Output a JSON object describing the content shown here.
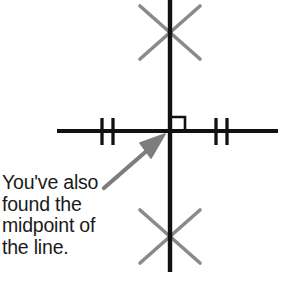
{
  "diagram": {
    "type": "geometric-construction",
    "canvas": {
      "width": 285,
      "height": 296,
      "background": "#ffffff"
    },
    "colors": {
      "line": "#111111",
      "construction_arc": "#8a8a8a",
      "arrow": "#7d7d7d",
      "text": "#1a1a1a"
    },
    "elements": {
      "vertical_line": {
        "label": "perpendicular bisector",
        "x": 170,
        "y_start": 0,
        "y_end": 272,
        "stroke_width": 4.2,
        "color": "#111111"
      },
      "horizontal_line": {
        "label": "original line segment",
        "y": 131,
        "x_start": 57,
        "x_end": 278,
        "stroke_width": 4.2,
        "color": "#111111"
      },
      "right_angle_marker": {
        "label": "right angle symbol",
        "x": 172,
        "y": 117,
        "size": 13,
        "stroke_width": 2.6,
        "color": "#111111"
      },
      "tick_marks": {
        "label": "equal length tick marks",
        "count": 4,
        "pairs": 2,
        "y_top": 118,
        "y_bottom": 145,
        "stroke_width": 3.2,
        "color": "#111111",
        "x_positions": [
          102,
          113,
          216,
          227
        ]
      },
      "arc_cross_top": {
        "label": "upper construction arc intersection",
        "center_x": 170,
        "center_y": 32,
        "half_width": 30,
        "half_height": 27,
        "stroke_width": 3.6,
        "color": "#8a8a8a"
      },
      "arc_cross_bottom": {
        "label": "lower construction arc intersection",
        "center_x": 170,
        "center_y": 236,
        "half_width": 30,
        "half_height": 27,
        "stroke_width": 3.6,
        "color": "#8a8a8a"
      },
      "pointer_arrow": {
        "label": "arrow pointing to midpoint",
        "tail_x": 104,
        "tail_y": 188,
        "tip_x": 164,
        "tip_y": 136,
        "stroke_width": 4.2,
        "head_length": 22,
        "head_width": 17,
        "color": "#7d7d7d"
      }
    }
  },
  "caption": {
    "name": "midpoint-caption",
    "full_text": "You've also found the midpoint of the line.",
    "lines": [
      "You've also",
      "found the",
      "midpoint of",
      "the line."
    ]
  }
}
